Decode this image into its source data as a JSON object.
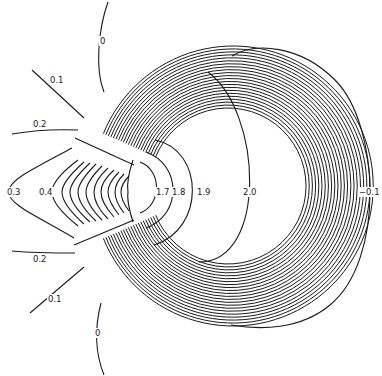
{
  "chart_data": {
    "type": "contour",
    "title": "",
    "xlabel": "",
    "ylabel": "",
    "grid": false,
    "legend": null,
    "geometry": {
      "center": [
        228,
        186
      ],
      "inner_radius": 78,
      "outer_radius": 140,
      "ring_count": 22,
      "gap_angle_deg": 22
    },
    "contour_levels": [
      -0.1,
      0,
      0.1,
      0.2,
      0.3,
      0.4,
      1.7,
      1.8,
      1.9,
      2.0
    ],
    "labels": [
      {
        "text": "0",
        "x": 100,
        "y": 44
      },
      {
        "text": "0.1",
        "x": 50,
        "y": 83
      },
      {
        "text": "0.2",
        "x": 33,
        "y": 127
      },
      {
        "text": "0.3",
        "x": 7,
        "y": 195
      },
      {
        "text": "0.4",
        "x": 39,
        "y": 195
      },
      {
        "text": "1.7",
        "x": 156,
        "y": 195
      },
      {
        "text": "1.8",
        "x": 172,
        "y": 195
      },
      {
        "text": "1.9",
        "x": 197,
        "y": 195
      },
      {
        "text": "2.0",
        "x": 243,
        "y": 195
      },
      {
        "text": "−0.1",
        "x": 359,
        "y": 195
      },
      {
        "text": "0.2",
        "x": 33,
        "y": 262
      },
      {
        "text": "0.1",
        "x": 48,
        "y": 302
      },
      {
        "text": "0",
        "x": 95,
        "y": 336
      }
    ]
  }
}
